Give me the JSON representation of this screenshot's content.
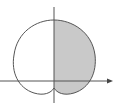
{
  "figure": {
    "curve": "r = a(1 + sin θ) style limaçon, inverted dimple at origin side",
    "shaded_region": "right half (x ≥ 0)",
    "colors": {
      "background": "#ffffff",
      "curve_stroke": "#555555",
      "axis_stroke": "#555555",
      "shade_fill": "#c9c9c9"
    },
    "axes": {
      "x_axis": {
        "arrow": true,
        "direction": "right"
      },
      "y_axis": {
        "arrow": false
      }
    }
  }
}
